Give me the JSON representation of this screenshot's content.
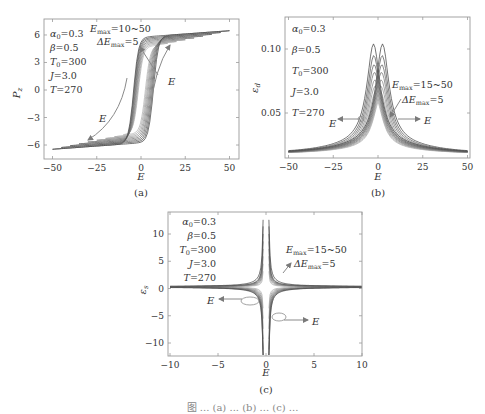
{
  "figure": {
    "caption_partial": "图 ... (a) ... (b) ... (c) ..."
  },
  "chart_data": [
    {
      "panel": "(a)",
      "type": "line",
      "title": "",
      "xlabel": "E",
      "ylabel": "P_z",
      "xlim": [
        -55,
        55
      ],
      "ylim": [
        -7.5,
        7.75
      ],
      "xticks": [
        -50,
        -25,
        0,
        25,
        50
      ],
      "yticks": [
        -6,
        -3,
        0,
        3,
        6
      ],
      "grid": false,
      "params": [
        "α0=0.3",
        "β=0.5",
        "T0=300",
        "J=3.0",
        "T=270"
      ],
      "annotation": [
        "Emax=10~50",
        "ΔEmax=5"
      ],
      "arrows": [
        "E (up, increasing branch)",
        "E (down, decreasing branch)"
      ],
      "series_description": "Family of hysteresis loops for Emax from 10 to 50 in steps of 5; saturation ≈ ±6.7 at |E|=50; coercive field ≈ ±4 to ±8",
      "emax_values": [
        10,
        15,
        20,
        25,
        30,
        35,
        40,
        45,
        50
      ],
      "saturation": 6.7
    },
    {
      "panel": "(b)",
      "type": "line",
      "title": "",
      "xlabel": "E",
      "ylabel": "ε_d",
      "xlim": [
        -52,
        52
      ],
      "ylim": [
        0.015,
        0.125
      ],
      "xticks": [
        -50,
        -25,
        0,
        25,
        50
      ],
      "yticks": [
        0.05,
        0.1
      ],
      "grid": false,
      "params": [
        "α0=0.3",
        "β=0.5",
        "T0=300",
        "J=3.0",
        "T=270"
      ],
      "annotation": [
        "Emax=15~50",
        "ΔEmax=5"
      ],
      "arrows": [
        "E (left)",
        "E (right)"
      ],
      "series_description": "Butterfly-shaped dielectric peaks near E≈±2.5, peak max ≈0.104 for largest Emax, tails ≈0.018 at |E|=50",
      "emax_values": [
        15,
        20,
        25,
        30,
        35,
        40,
        45,
        50
      ],
      "peak_values": [
        0.062,
        0.066,
        0.071,
        0.076,
        0.082,
        0.088,
        0.095,
        0.104
      ],
      "tail_value": 0.018
    },
    {
      "panel": "(c)",
      "type": "line",
      "title": "",
      "xlabel": "E",
      "ylabel": "ε_s",
      "xlim": [
        -10,
        10
      ],
      "ylim": [
        -12.4,
        14
      ],
      "xticks": [
        -10,
        -5,
        0,
        5,
        10
      ],
      "yticks": [
        -10,
        -5,
        0,
        5,
        10
      ],
      "grid": false,
      "params": [
        "α0=0.3",
        "β=0.5",
        "T0=300",
        "J=3.0",
        "T=270"
      ],
      "annotation": [
        "Emax=15~50",
        "ΔEmax=5"
      ],
      "arrows": [
        "E (left)",
        "E (right)"
      ],
      "series_description": "Cross/star-shaped curves diverging near E≈±0.3 to about ±12, baseline ≈0.3 at |E|=10",
      "emax_values": [
        15,
        20,
        25,
        30,
        35,
        40,
        45,
        50
      ]
    }
  ],
  "panels": {
    "a": {
      "label": "(a)",
      "xlabel": "E",
      "ylabel": "P",
      "ylabel_sub": "z",
      "xticks": [
        "−50",
        "−25",
        "0",
        "25",
        "50"
      ],
      "yticks": [
        "6",
        "3",
        "0",
        "−3",
        "−6"
      ],
      "params": [
        {
          "sym": "α",
          "sub": "0",
          "val": "=0.3"
        },
        {
          "sym": "β",
          "sub": "",
          "val": "=0.5"
        },
        {
          "sym": "T",
          "sub": "0",
          "val": "=300"
        },
        {
          "sym": "J",
          "sub": "",
          "val": "=3.0"
        },
        {
          "sym": "T",
          "sub": "",
          "val": "=270"
        }
      ],
      "ann1": {
        "sym": "E",
        "sub": "max",
        "val": "=10~50"
      },
      "ann2": {
        "sym": "ΔE",
        "sub": "max",
        "val": "=5"
      },
      "arrow_label": "E"
    },
    "b": {
      "label": "(b)",
      "xlabel": "E",
      "ylabel": "ε",
      "ylabel_sub": "d",
      "xticks": [
        "−50",
        "−25",
        "0",
        "25",
        "50"
      ],
      "yticks": [
        "0.10",
        "0.05"
      ],
      "params": [
        {
          "sym": "α",
          "sub": "0",
          "val": "=0.3"
        },
        {
          "sym": "β",
          "sub": "",
          "val": "=0.5"
        },
        {
          "sym": "T",
          "sub": "0",
          "val": "=300"
        },
        {
          "sym": "J",
          "sub": "",
          "val": "=3.0"
        },
        {
          "sym": "T",
          "sub": "",
          "val": "=270"
        }
      ],
      "ann1": {
        "sym": "E",
        "sub": "max",
        "val": "=15~50"
      },
      "ann2": {
        "sym": "ΔE",
        "sub": "max",
        "val": "=5"
      },
      "arrow_label": "E"
    },
    "c": {
      "label": "(c)",
      "xlabel": "E",
      "ylabel": "ε",
      "ylabel_sub": "s",
      "xticks": [
        "−10",
        "−5",
        "0",
        "5",
        "10"
      ],
      "yticks": [
        "10",
        "5",
        "0",
        "−5",
        "−10"
      ],
      "params": [
        {
          "sym": "α",
          "sub": "0",
          "val": "=0.3"
        },
        {
          "sym": "β",
          "sub": "",
          "val": "=0.5"
        },
        {
          "sym": "T",
          "sub": "0",
          "val": "=300"
        },
        {
          "sym": "J",
          "sub": "",
          "val": "=3.0"
        },
        {
          "sym": "T",
          "sub": "",
          "val": "=270"
        }
      ],
      "ann1": {
        "sym": "E",
        "sub": "max",
        "val": "=15~50"
      },
      "ann2": {
        "sym": "ΔE",
        "sub": "max",
        "val": "=5"
      },
      "arrow_label": "E"
    }
  },
  "colors": {
    "frame": "#9a9a9a",
    "curve_dark": "#555555",
    "curve_light": "#b0b0b0",
    "arrow": "#8a8a8a"
  }
}
